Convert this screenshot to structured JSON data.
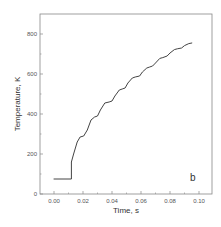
{
  "chart_data": {
    "type": "line",
    "title": "",
    "panel_label": "b",
    "xlabel": "Time, s",
    "ylabel": "Temperature, K",
    "xlim": [
      -0.009,
      0.109
    ],
    "ylim": [
      0,
      900
    ],
    "x_ticks": [
      0.0,
      0.02,
      0.04,
      0.06,
      0.08,
      0.1
    ],
    "x_tick_labels": [
      "0.00",
      "0.02",
      "0.04",
      "0.06",
      "0.08",
      "0.10"
    ],
    "y_ticks": [
      0,
      200,
      400,
      600,
      800
    ],
    "y_tick_labels": [
      "0",
      "200",
      "400",
      "600",
      "800"
    ],
    "grid": false,
    "legend": null,
    "series": [
      {
        "name": "Temperature",
        "color": "#444444",
        "x": [
          0.0,
          0.012,
          0.012,
          0.0135,
          0.016,
          0.018,
          0.0205,
          0.023,
          0.0255,
          0.028,
          0.03,
          0.032,
          0.035,
          0.038,
          0.04,
          0.042,
          0.045,
          0.047,
          0.049,
          0.051,
          0.054,
          0.056,
          0.059,
          0.061,
          0.064,
          0.066,
          0.068,
          0.07,
          0.073,
          0.075,
          0.078,
          0.08,
          0.083,
          0.085,
          0.088,
          0.09,
          0.093,
          0.095
        ],
        "y": [
          75,
          75,
          160,
          200,
          260,
          285,
          290,
          320,
          370,
          385,
          390,
          420,
          455,
          460,
          465,
          490,
          520,
          525,
          530,
          555,
          580,
          585,
          590,
          610,
          630,
          635,
          640,
          655,
          678,
          682,
          690,
          705,
          722,
          726,
          730,
          742,
          752,
          755
        ]
      }
    ]
  }
}
